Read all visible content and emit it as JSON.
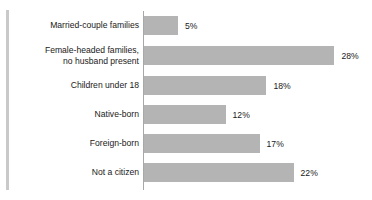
{
  "chart_data": {
    "type": "bar",
    "orientation": "horizontal",
    "title": "",
    "subtitle": "",
    "xlabel": "",
    "ylabel": "",
    "categories": [
      "Married-couple families",
      "Female-headed families,\nno husband present",
      "Children under 18",
      "Native-born",
      "Foreign-born",
      "Not a citizen"
    ],
    "values": [
      5,
      28,
      18,
      12,
      17,
      22
    ],
    "value_labels": [
      "5%",
      "28%",
      "18%",
      "12%",
      "17%",
      "22%"
    ],
    "unit": "%",
    "xlim": [
      0,
      28
    ],
    "grid": false,
    "legend": null,
    "series": [
      {
        "name": "",
        "values": [
          5,
          28,
          18,
          12,
          17,
          22
        ]
      }
    ]
  },
  "style": {
    "bar_color": "#b4b4b4",
    "axis_color": "#a8a8a8",
    "rule_color": "#c9c9c9",
    "text_color": "#1a1a1a",
    "background": "#ffffff",
    "px_per_unit": 6.8
  }
}
